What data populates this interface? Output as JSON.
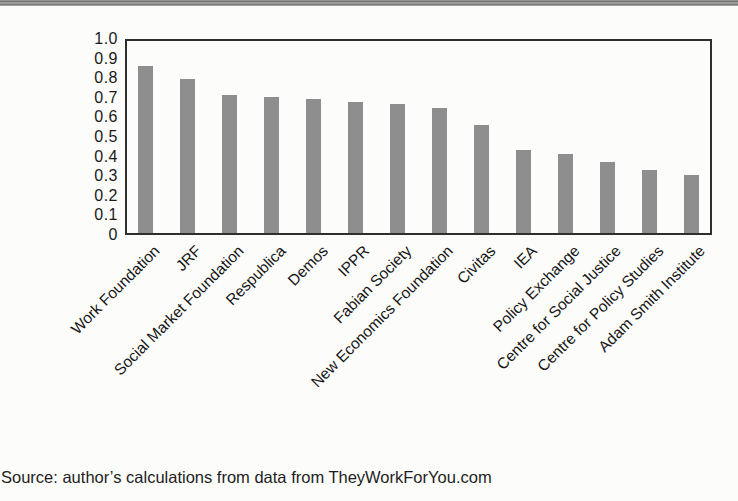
{
  "chart_data": {
    "type": "bar",
    "categories": [
      "Work Foundation",
      "JRF",
      "Social Market Foundation",
      "Respublica",
      "Demos",
      "IPPR",
      "Fabian Society",
      "New Economics Foundation",
      "Civitas",
      "IEA",
      "Policy Exchange",
      "Centre for Social Justice",
      "Centre for Policy Studies",
      "Adam Smith Institute"
    ],
    "values": [
      0.87,
      0.8,
      0.72,
      0.71,
      0.7,
      0.68,
      0.67,
      0.65,
      0.56,
      0.43,
      0.41,
      0.37,
      0.33,
      0.3
    ],
    "title": "",
    "xlabel": "",
    "ylabel": "",
    "ylim": [
      0,
      1.0
    ],
    "ytick_labels": [
      "1.0",
      "0.9",
      "0.8",
      "0.7",
      "0.6",
      "0.5",
      "0.4",
      "0.3",
      "0.2",
      "0.1",
      "0"
    ],
    "grid": false,
    "legend_position": "none",
    "x_label_rotation_deg": 45,
    "bar_color": "#8e8e8e",
    "axis_color": "#2f2f2f"
  },
  "footer": {
    "source_text": "Source: author’s calculations from data from TheyWorkForYou.com"
  }
}
